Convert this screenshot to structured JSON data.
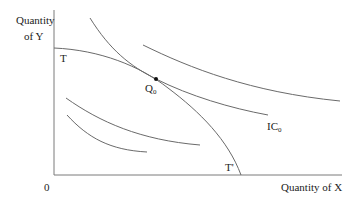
{
  "diagram": {
    "type": "production-possibility-frontier-with-indifference-curves",
    "y_axis_label_line1": "Quantity",
    "y_axis_label_line2": "of Y",
    "x_axis_label": "Quantity of X",
    "origin_label": "0",
    "frontier_start_label": "T",
    "frontier_end_label": "T'",
    "point_label": "Q",
    "point_subscript": "0",
    "indifference_label": "IC",
    "indifference_subscript": "0",
    "colors": {
      "line": "#6a6a6a",
      "axis": "#7a7a7a",
      "point": "#111111",
      "text": "#222222"
    }
  }
}
